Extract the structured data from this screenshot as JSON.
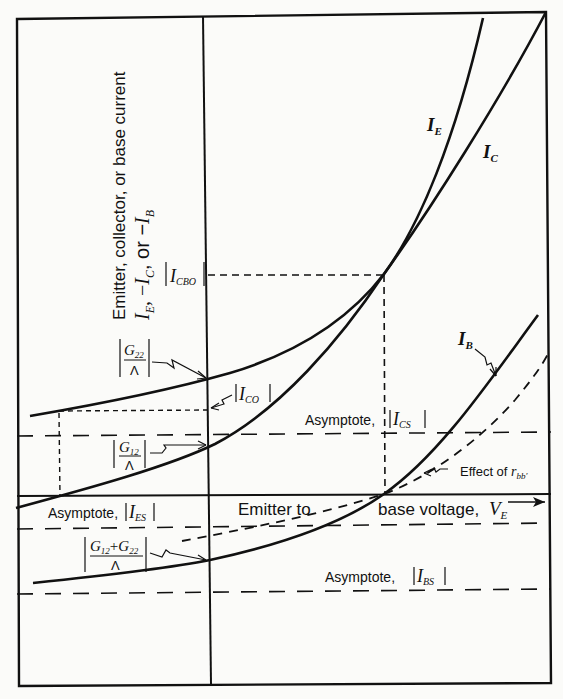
{
  "figure": {
    "y_axis_label_line1": "Emitter, collector, or base current",
    "y_axis_label_line2": {
      "I_E": "I",
      "I_E_sub": "E",
      "sep1": ", −",
      "I_C": "I",
      "I_C_sub": "C",
      "sep2": ", or −",
      "I_B": "I",
      "I_B_sub": "B"
    },
    "x_axis_label_left": "Emitter to",
    "x_axis_label_right": "base voltage,",
    "x_axis_var": "V",
    "x_axis_var_sub": "E",
    "curves": {
      "emitter": {
        "label": "I",
        "sub": "E"
      },
      "collector": {
        "label": "I",
        "sub": "C"
      },
      "base": {
        "label": "I",
        "sub": "B"
      },
      "rbb_effect": {
        "label": "Effect of",
        "var": "r",
        "sub": "bb′"
      }
    },
    "markers": {
      "icbo": {
        "label": "I",
        "sub": "CBO"
      },
      "ico": {
        "label": "I",
        "sub": "CO"
      },
      "g22": {
        "num": "G",
        "num_sub": "22",
        "den": "Λ"
      },
      "g12": {
        "num": "G",
        "num_sub": "12",
        "den": "Λ"
      },
      "g12_g22": {
        "num_a": "G",
        "num_a_sub": "12",
        "plus": "+",
        "num_b": "G",
        "num_b_sub": "22",
        "den": "Λ"
      }
    },
    "asymptotes": {
      "ics": {
        "prefix": "Asymptote,",
        "label": "I",
        "sub": "CS"
      },
      "ies": {
        "prefix": "Asymptote,",
        "label": "I",
        "sub": "ES"
      },
      "ibs": {
        "prefix": "Asymptote,",
        "label": "I",
        "sub": "BS"
      }
    },
    "colors": {
      "ink": "#111111",
      "paper": "#fbfbf9"
    }
  }
}
